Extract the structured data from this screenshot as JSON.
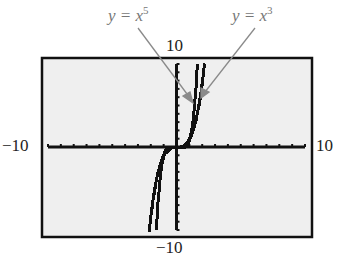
{
  "chart_data": {
    "type": "line",
    "title": "",
    "xlabel": "",
    "ylabel": "",
    "xlim": [
      -10,
      10
    ],
    "ylim": [
      -10,
      10
    ],
    "x_tick_interval": 1,
    "y_tick_interval": 1,
    "grid": false,
    "window_labels": {
      "xmin": "−10",
      "xmax": "10",
      "ymin": "−10",
      "ymax": "10"
    },
    "series": [
      {
        "name": "y = x^5",
        "label_text": "y = x",
        "exponent": "5",
        "x": [
          -1.6,
          -1.4,
          -1.2,
          -1.0,
          -0.8,
          0,
          0.8,
          1.0,
          1.2,
          1.4,
          1.6
        ],
        "y": [
          -10.49,
          -5.38,
          -2.49,
          -1.0,
          -0.33,
          0,
          0.33,
          1.0,
          2.49,
          5.38,
          10.49
        ]
      },
      {
        "name": "y = x^3",
        "label_text": "y = x",
        "exponent": "3",
        "x": [
          -2.2,
          -2.0,
          -1.6,
          -1.2,
          -0.8,
          0,
          0.8,
          1.2,
          1.6,
          2.0,
          2.2
        ],
        "y": [
          -10.65,
          -8.0,
          -4.1,
          -1.73,
          -0.51,
          0,
          0.51,
          1.73,
          4.1,
          8.0,
          10.65
        ]
      }
    ],
    "annotations": [
      {
        "text": "y = x^5",
        "arrow_to": "x^5 curve near (1.3, 6)"
      },
      {
        "text": "y = x^3",
        "arrow_to": "x^3 curve near (1.8, 6)"
      }
    ]
  },
  "labels": {
    "ymax": "10",
    "ymin": "−10",
    "xmin": "−10",
    "xmax": "10",
    "eq5_base": "y = x",
    "eq5_exp": "5",
    "eq3_base": "y = x",
    "eq3_exp": "3"
  },
  "colors": {
    "screen_bg": "#efefef",
    "frame": "#111111",
    "plot": "#111111",
    "annotation": "#888888"
  }
}
